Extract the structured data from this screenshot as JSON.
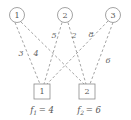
{
  "diagram": {
    "type": "bipartite-assignment-graph",
    "background_color": "#ffffff",
    "edge_color": "#8c8c8c",
    "node_stroke_color": "#8c8c8c",
    "text_color": "#555555",
    "edge_style": "dashed",
    "source_nodes": [
      {
        "id": "circle-1",
        "label": "1",
        "cx": 17,
        "cy": 15,
        "r": 7.5
      },
      {
        "id": "circle-2",
        "label": "2",
        "cx": 65,
        "cy": 15,
        "r": 7.5
      },
      {
        "id": "circle-3",
        "label": "3",
        "cx": 113,
        "cy": 15,
        "r": 7.5
      }
    ],
    "sink_nodes": [
      {
        "id": "square-1",
        "label": "1",
        "x": 34,
        "y": 84,
        "w": 16,
        "h": 15
      },
      {
        "id": "square-2",
        "label": "2",
        "x": 79,
        "y": 84,
        "w": 16,
        "h": 15
      }
    ],
    "edges": [
      {
        "id": "edge-1-1",
        "from": "circle-1",
        "to": "square-1",
        "weight": "3",
        "x1": 15,
        "y1": 22.5,
        "x2": 40,
        "y2": 84,
        "lx": 21,
        "ly": 53
      },
      {
        "id": "edge-1-2",
        "from": "circle-1",
        "to": "square-2",
        "weight": "4",
        "x1": 21,
        "y1": 22,
        "x2": 84,
        "y2": 84,
        "lx": 36,
        "ly": 53
      },
      {
        "id": "edge-2-1",
        "from": "circle-2",
        "to": "square-1",
        "weight": "5",
        "x1": 62,
        "y1": 22.5,
        "x2": 44,
        "y2": 84,
        "lx": 54,
        "ly": 35
      },
      {
        "id": "edge-2-2",
        "from": "circle-2",
        "to": "square-2",
        "weight": "2",
        "x1": 68,
        "y1": 22.5,
        "x2": 86,
        "y2": 84,
        "lx": 74,
        "ly": 35
      },
      {
        "id": "edge-3-1",
        "from": "circle-3",
        "to": "square-1",
        "weight": "8",
        "x1": 108,
        "y1": 21,
        "x2": 47,
        "y2": 84,
        "lx": 91,
        "ly": 34
      },
      {
        "id": "edge-3-2",
        "from": "circle-3",
        "to": "square-2",
        "weight": "6",
        "x1": 113,
        "y1": 22.5,
        "x2": 90,
        "y2": 84,
        "lx": 108,
        "ly": 60
      }
    ],
    "supply_labels": [
      {
        "id": "supply-f1",
        "base": "f",
        "subscript": "1",
        "equals": "= 4",
        "full_text": "f1 = 4",
        "x": 42,
        "y": 110
      },
      {
        "id": "supply-f2",
        "base": "f",
        "subscript": "2",
        "equals": "= 6",
        "full_text": "f2 = 6",
        "x": 89,
        "y": 110
      }
    ]
  }
}
